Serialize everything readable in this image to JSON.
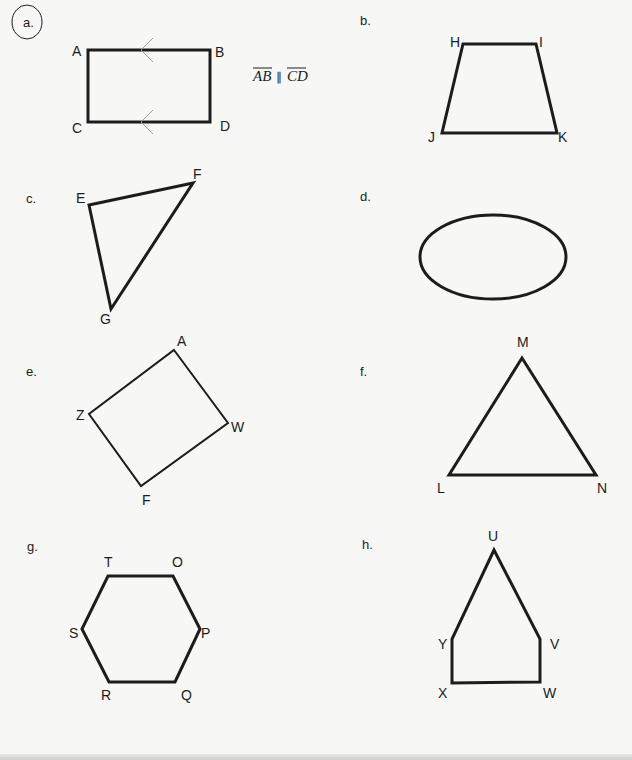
{
  "worksheet": {
    "colors": {
      "background": "#f7f7f5",
      "stroke": "#1c1c1c",
      "arrow": "#9a9a9a"
    },
    "items": [
      {
        "id": "a",
        "label": "a.",
        "label_circled": true,
        "shape": "rectangle",
        "vertices": [
          "A",
          "B",
          "C",
          "D"
        ],
        "notation": {
          "seg1": "AB",
          "parallel": "∥",
          "seg2": "CD"
        },
        "parallel_marks": true
      },
      {
        "id": "b",
        "label": "b.",
        "shape": "trapezoid",
        "vertices": [
          "H",
          "I",
          "J",
          "K"
        ]
      },
      {
        "id": "c",
        "label": "c.",
        "shape": "triangle",
        "vertices": [
          "E",
          "F",
          "G"
        ]
      },
      {
        "id": "d",
        "label": "d.",
        "shape": "ellipse",
        "vertices": []
      },
      {
        "id": "e",
        "label": "e.",
        "shape": "quadrilateral",
        "vertices": [
          "A",
          "W",
          "F",
          "Z"
        ]
      },
      {
        "id": "f",
        "label": "f.",
        "shape": "triangle",
        "vertices": [
          "M",
          "L",
          "N"
        ]
      },
      {
        "id": "g",
        "label": "g.",
        "shape": "hexagon",
        "vertices": [
          "T",
          "O",
          "P",
          "Q",
          "R",
          "S"
        ]
      },
      {
        "id": "h",
        "label": "h.",
        "shape": "pentagon",
        "vertices": [
          "U",
          "V",
          "W",
          "X",
          "Y"
        ]
      }
    ]
  }
}
